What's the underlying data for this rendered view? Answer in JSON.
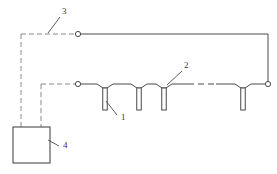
{
  "figure": {
    "type": "technical-schematic",
    "title": "",
    "background_color": "#ffffff",
    "line_color": "#4a4a4a",
    "dashed_color": "#8a8a8a",
    "label_color": "#3a3a3a",
    "width": 277,
    "height": 174
  },
  "callouts": [
    {
      "id": "1",
      "label": "1",
      "x": 121,
      "y": 120,
      "leader_from_x": 117,
      "leader_from_y": 115,
      "leader_to_x": 106,
      "leader_to_y": 101,
      "refers_to": "tube-electrode"
    },
    {
      "id": "2",
      "label": "2",
      "x": 184,
      "y": 68,
      "leader_from_x": 182,
      "leader_from_y": 71,
      "leader_to_x": 167,
      "leader_to_y": 85,
      "refers_to": "branch-junction"
    },
    {
      "id": "3",
      "label": "3",
      "x": 62,
      "y": 14,
      "leader_from_x": 60,
      "leader_from_y": 17,
      "leader_to_x": 48,
      "leader_to_y": 33,
      "refers_to": "dashed-signal-line"
    },
    {
      "id": "4",
      "label": "4",
      "x": 63,
      "y": 148,
      "leader_from_x": 59,
      "leader_from_y": 146,
      "leader_to_x": 48,
      "leader_to_y": 140,
      "refers_to": "control-box"
    }
  ],
  "control_box": {
    "name": "control-box",
    "x": 13,
    "y": 127,
    "width": 37,
    "height": 36
  },
  "nodes": [
    {
      "name": "node-top-left",
      "x": 78,
      "y": 34,
      "r": 2.6
    },
    {
      "name": "node-mid-left",
      "x": 78,
      "y": 84,
      "r": 2.6
    },
    {
      "name": "node-mid-right",
      "x": 268,
      "y": 84,
      "r": 2.6
    }
  ],
  "tubes": [
    {
      "name": "tube-1",
      "cx": 105,
      "top": 88,
      "width": 4.5,
      "height": 22
    },
    {
      "name": "tube-2",
      "cx": 139,
      "top": 88,
      "width": 4.5,
      "height": 22
    },
    {
      "name": "tube-3",
      "cx": 164,
      "top": 88,
      "width": 4.5,
      "height": 22
    },
    {
      "name": "tube-4",
      "cx": 243,
      "top": 88,
      "width": 4.5,
      "height": 22
    }
  ],
  "solid_paths": {
    "top_rail": "M 80.6 34 L 268 34 L 268 81.4",
    "mid_rail_left": "M 80.6 84 L 97 84 L 103 88 L 107 88 L 113 84 L 131 84 L 137 88 L 141 88 L 147 84 L 156 84 L 162 88 L 166 88 L 172 84 L 188 84",
    "mid_rail_right": "M 216 84 L 235 84 L 241 88 L 245 88 L 251 84 L 265.4 84"
  },
  "dashed_paths": {
    "signal_upper": "M 21 34 L 78 34",
    "signal_upper_drop": "M 21 34 L 21 140",
    "signal_lower": "M 41 84 L 78 84",
    "signal_lower_drop": "M 41 84 L 41 140",
    "mid_rail_gap": "M 188 84 L 216 84"
  },
  "dash_pattern": "5,3",
  "dash_pattern_gap": "6,4"
}
